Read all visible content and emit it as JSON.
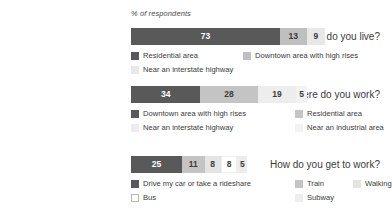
{
  "chart_data": {
    "type": "bar",
    "orientation": "horizontal",
    "stacked": true,
    "title": "",
    "xlabel": "% of respondents",
    "ylabel": "",
    "grid": false,
    "legend_position": "below each bar",
    "axis_title": "% of respondents",
    "xlim": [
      0,
      95
    ],
    "groups": [
      {
        "category": "Where do you live?",
        "segments": [
          {
            "label": "Residential area",
            "value": 73,
            "color": "#595959",
            "text_color": "#ffffff"
          },
          {
            "label": "Downtown area with high rises",
            "value": 13,
            "color": "#bfbfbf",
            "text_color": "#3b3b3b"
          },
          {
            "label": "Near an interstate highway",
            "value": 9,
            "color": "#e8e8e8",
            "text_color": "#3b3b3b"
          }
        ],
        "legend_rows": [
          [
            "Residential area",
            "Downtown area with high rises"
          ],
          [
            "Near an interstate highway"
          ]
        ]
      },
      {
        "category": "Where do you work?",
        "segments": [
          {
            "label": "Downtown area with high rises",
            "value": 34,
            "color": "#595959",
            "text_color": "#ffffff"
          },
          {
            "label": "Residential area",
            "value": 28,
            "color": "#c4c4c4",
            "text_color": "#3b3b3b"
          },
          {
            "label": "Near an interstate highway",
            "value": 19,
            "color": "#ededed",
            "text_color": "#3b3b3b"
          },
          {
            "label": "Near an industrial area",
            "value": 5,
            "color": "#f2f2f2",
            "text_color": "#3b3b3b"
          }
        ],
        "legend_rows": [
          [
            "Downtown area with high rises",
            "Residential area"
          ],
          [
            "Near an interstate highway",
            "Near an industrial area"
          ]
        ]
      },
      {
        "category": "How do you get to work?",
        "segments": [
          {
            "label": "Drive my car or take a rideshare",
            "value": 25,
            "color": "#595959",
            "text_color": "#ffffff"
          },
          {
            "label": "Train",
            "value": 11,
            "color": "#c4c4c4",
            "text_color": "#3b3b3b"
          },
          {
            "label": "Walking",
            "value": 8,
            "color": "#e4e4e4",
            "text_color": "#3b3b3b"
          },
          {
            "label": "Bus",
            "value": 8,
            "color": "#ffffff",
            "text_color": "#3b3b3b"
          },
          {
            "label": "Subway",
            "value": 5,
            "color": "#ededed",
            "text_color": "#3b3b3b"
          }
        ],
        "legend_rows": [
          [
            "Drive my car or take a rideshare",
            "Train",
            "Walking"
          ],
          [
            "Bus",
            "Subway"
          ]
        ]
      }
    ]
  },
  "colors": {
    "dark": "#595959",
    "mid": "#c4c4c4",
    "light": "#e4e4e4",
    "lighter": "#ededed",
    "lightest": "#f2f2f2",
    "white": "#ffffff",
    "text": "#3b3b3b"
  }
}
